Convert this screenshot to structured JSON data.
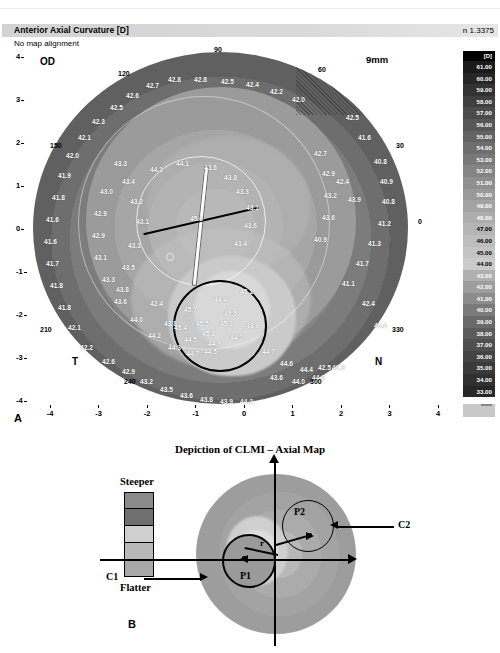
{
  "header": {
    "title": "Anterior Axial Curvature  [D]",
    "subtitle": "No map alignment",
    "refractive_index": "n 1.3375"
  },
  "scale": {
    "unit_label": "[D]",
    "values": [
      "61.00",
      "60.00",
      "59.00",
      "58.00",
      "57.00",
      "56.00",
      "55.00",
      "54.00",
      "53.00",
      "52.00",
      "51.00",
      "50.00",
      "49.00",
      "48.00",
      "47.00",
      "46.00",
      "45.00",
      "44.00",
      "43.00",
      "42.00",
      "41.00",
      "40.00",
      "39.00",
      "38.00",
      "37.00",
      "36.00",
      "35.00",
      "34.00",
      "33.00"
    ],
    "colors": [
      "#1a1a1a",
      "#262626",
      "#333333",
      "#3f3f3f",
      "#4b4b4b",
      "#575757",
      "#636363",
      "#6e6e6e",
      "#797979",
      "#848484",
      "#8f8f8f",
      "#999999",
      "#a3a3a3",
      "#adadad",
      "#b5b5b5",
      "#bdbdbd",
      "#c4c4c4",
      "#cbcbcb",
      "#b0b0b0",
      "#9e9e9e",
      "#8c8c8c",
      "#7a7a7a",
      "#6a6a6a",
      "#5c5c5c",
      "#4f4f4f",
      "#444444",
      "#3a3a3a",
      "#303030",
      "#272727"
    ]
  },
  "map": {
    "eye_label": "OD",
    "diameter_label": "9mm",
    "quadrants": {
      "temporal": "T",
      "nasal": "N"
    },
    "degrees": [
      "90",
      "120",
      "150",
      "210",
      "240",
      "300",
      "330",
      "30",
      "60",
      "0"
    ],
    "x_ticks": [
      "-4",
      "-3",
      "-2",
      "-1",
      "0",
      "1",
      "2",
      "3",
      "4"
    ],
    "y_ticks": [
      "4",
      "3",
      "2",
      "1",
      "0",
      "-1",
      "-2",
      "-3",
      "-4"
    ],
    "panel_label": "A",
    "values": [
      "42.8",
      "42.8",
      "42.5",
      "42.4",
      "42.2",
      "42.0",
      "42.7",
      "42.6",
      "42.5",
      "42.3",
      "42.1",
      "42.0",
      "41.9",
      "41.8",
      "41.6",
      "41.6",
      "41.7",
      "41.8",
      "41.8",
      "42.1",
      "42.2",
      "42.6",
      "42.9",
      "43.2",
      "43.5",
      "43.6",
      "43.8",
      "43.9",
      "44.2",
      "43.3",
      "43.4",
      "43.2",
      "43.1",
      "43.3",
      "43.5",
      "43.8",
      "43.0",
      "42.9",
      "42.9",
      "43.1",
      "43.3",
      "43.6",
      "44.0",
      "44.2",
      "44.3",
      "44.7",
      "44.5",
      "44.1",
      "44.1",
      "43.6",
      "43.8",
      "43.3",
      "43.1",
      "43.6",
      "43.4",
      "42.4",
      "43.8",
      "44.5",
      "44.9",
      "44.0",
      "43.9",
      "44.4",
      "45.1",
      "45.5",
      "45.3",
      "45.7",
      "45.4",
      "45.8",
      "45.5",
      "44.7",
      "44.6",
      "44.4",
      "42.5",
      "42.7",
      "42.9",
      "43.2",
      "43.6",
      "40.9",
      "40.8",
      "40.9",
      "40.8",
      "41.2",
      "41.3",
      "41.7",
      "41.1",
      "41.6",
      "42.5",
      "42.4",
      "43.9",
      "43.6",
      "44.0",
      "44.3",
      "41.9",
      "42.4",
      "45.6"
    ]
  },
  "clmi": {
    "title": "Depiction of CLMI – Axial Map",
    "legend_top": "Steeper",
    "legend_bottom": "Flatter",
    "legend_colors": [
      "#8a8a8a",
      "#6f6f6f",
      "#cfcfcf",
      "#b8b8b8",
      "#a8a8a8"
    ],
    "labels": {
      "c1": "C1",
      "c2": "C2",
      "p1": "P1",
      "p2": "P2",
      "radius": "r"
    },
    "panel_label": "B"
  }
}
